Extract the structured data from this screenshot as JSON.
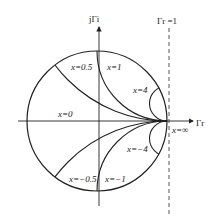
{
  "diagram": {
    "type": "smith-chart-reactance-circles",
    "axes": {
      "imag_label": "jΓi",
      "real_label": "Γr",
      "boundary_label": "Γr =1"
    },
    "curves": [
      {
        "name": "x0",
        "label": "x=0"
      },
      {
        "name": "x05",
        "label": "x=0.5"
      },
      {
        "name": "x1",
        "label": "x=1"
      },
      {
        "name": "x4",
        "label": "x=4"
      },
      {
        "name": "xm05",
        "label": "x=−0.5"
      },
      {
        "name": "xm1",
        "label": "x=−1"
      },
      {
        "name": "xm4",
        "label": "x=−4"
      },
      {
        "name": "xinf",
        "label": "x=∞"
      }
    ],
    "colors": {
      "line": "#222222",
      "dashed": "#444444",
      "background": "#ffffff"
    }
  }
}
